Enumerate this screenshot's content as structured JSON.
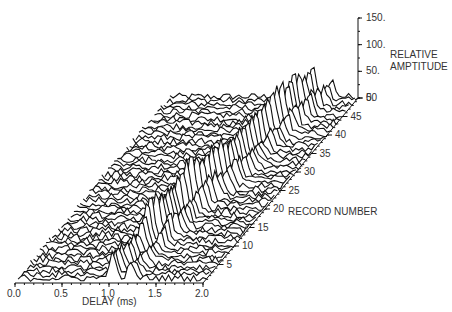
{
  "chart_data": {
    "type": "waterfall-3d-line",
    "title": "",
    "xlabel": "DELAY (ms)",
    "ylabel": "RECORD NUMBER",
    "zlabel": [
      "RELATIVE",
      "AMPTITUDE"
    ],
    "x_ticks": [
      "0.0",
      "0.5",
      "1.0",
      "1.5",
      "2.0"
    ],
    "x_range": [
      0.0,
      2.0
    ],
    "record_ticks": [
      "5",
      "10",
      "15",
      "20",
      "25",
      "30",
      "35",
      "40",
      "45",
      "50"
    ],
    "record_range": [
      1,
      50
    ],
    "z_ticks": [
      "0.",
      "50.",
      "100.",
      "150."
    ],
    "z_range": [
      0,
      150
    ],
    "grid": false,
    "legend": null,
    "num_records": 50,
    "noise_amplitude": 8,
    "peaks_note": "Dominant echo peak drifts from ~1.0 ms delay at record 1 to ~1.45 ms at record 50, with secondary peak trailing by ~0.15-0.25 ms",
    "peak_track": [
      {
        "record": 1,
        "delay": 1.0,
        "amplitude": 45
      },
      {
        "record": 3,
        "delay": 1.0,
        "amplitude": 40
      },
      {
        "record": 8,
        "delay": 1.05,
        "amplitude": 35
      },
      {
        "record": 12,
        "delay": 1.05,
        "amplitude": 85
      },
      {
        "record": 14,
        "delay": 1.1,
        "amplitude": 65
      },
      {
        "record": 18,
        "delay": 1.1,
        "amplitude": 55
      },
      {
        "record": 22,
        "delay": 1.15,
        "amplitude": 90
      },
      {
        "record": 24,
        "delay": 1.2,
        "amplitude": 70
      },
      {
        "record": 27,
        "delay": 1.25,
        "amplitude": 75
      },
      {
        "record": 30,
        "delay": 1.3,
        "amplitude": 60
      },
      {
        "record": 33,
        "delay": 1.3,
        "amplitude": 55
      },
      {
        "record": 38,
        "delay": 1.35,
        "amplitude": 60
      },
      {
        "record": 42,
        "delay": 1.4,
        "amplitude": 80
      },
      {
        "record": 44,
        "delay": 1.45,
        "amplitude": 70
      },
      {
        "record": 46,
        "delay": 1.45,
        "amplitude": 75
      },
      {
        "record": 48,
        "delay": 1.5,
        "amplitude": 55
      }
    ]
  },
  "labels": {
    "xlabel": "DELAY (ms)",
    "record_label": "RECORD NUMBER",
    "amp_label_1": "RELATIVE",
    "amp_label_2": "AMPTITUDE"
  }
}
